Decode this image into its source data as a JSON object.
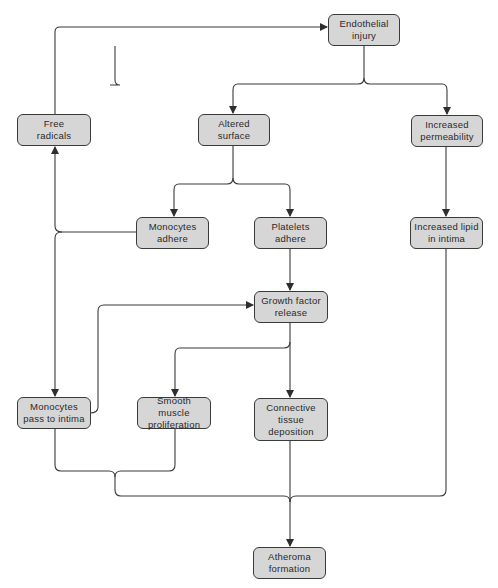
{
  "diagram": {
    "type": "flowchart",
    "colors": {
      "node_fill": "#d6d6d6",
      "node_border": "#3a3a3a",
      "line": "#3a3a3a",
      "background": "#ffffff"
    },
    "nodes": {
      "endothelial_injury": "Endothelial\ninjury",
      "free_radicals": "Free\nradicals",
      "altered_surface": "Altered\nsurface",
      "increased_permeability": "Increased\npermeability",
      "monocytes_adhere": "Monocytes\nadhere",
      "platelets_adhere": "Platelets\nadhere",
      "increased_lipid": "Increased lipid\nin intima",
      "growth_factor_release": "Growth factor\nrelease",
      "monocytes_pass": "Monocytes\npass to intima",
      "smooth_muscle": "Smooth muscle\nproliferation",
      "connective_tissue": "Connective\ntissue\ndeposition",
      "atheroma_formation": "Atheroma\nformation"
    },
    "edges": [
      {
        "from": "Free radicals",
        "to": "Endothelial injury"
      },
      {
        "from": "Endothelial injury",
        "to": "Altered surface"
      },
      {
        "from": "Endothelial injury",
        "to": "Increased permeability"
      },
      {
        "from": "Altered surface",
        "to": "Monocytes adhere"
      },
      {
        "from": "Altered surface",
        "to": "Platelets adhere"
      },
      {
        "from": "Monocytes adhere",
        "to": "Free radicals"
      },
      {
        "from": "Monocytes adhere",
        "to": "Monocytes pass to intima"
      },
      {
        "from": "Increased permeability",
        "to": "Increased lipid in intima"
      },
      {
        "from": "Platelets adhere",
        "to": "Growth factor release"
      },
      {
        "from": "Monocytes pass to intima",
        "to": "Growth factor release"
      },
      {
        "from": "Growth factor release",
        "to": "Smooth muscle proliferation"
      },
      {
        "from": "Growth factor release",
        "to": "Connective tissue deposition"
      },
      {
        "from": "Monocytes pass to intima",
        "to": "Atheroma formation"
      },
      {
        "from": "Smooth muscle proliferation",
        "to": "Atheroma formation"
      },
      {
        "from": "Connective tissue deposition",
        "to": "Atheroma formation"
      },
      {
        "from": "Increased lipid in intima",
        "to": "Atheroma formation"
      }
    ]
  }
}
